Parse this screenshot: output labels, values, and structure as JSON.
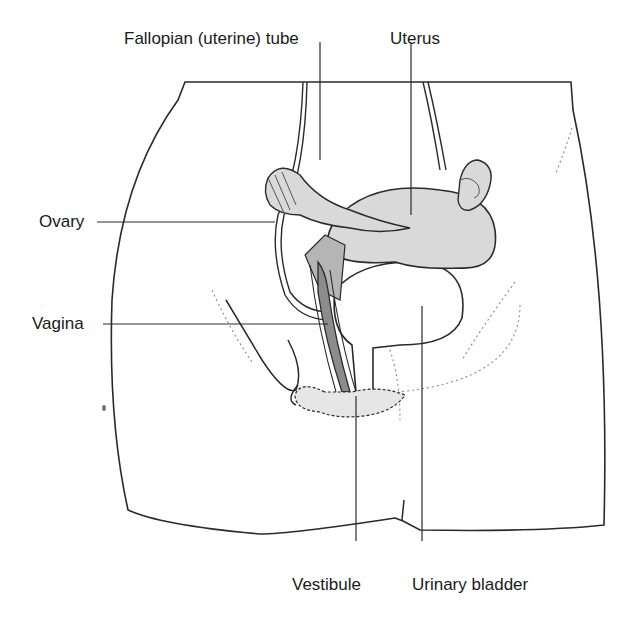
{
  "diagram": {
    "labels": [
      {
        "id": "fallopian-tube",
        "text": "Fallopian (uterine) tube"
      },
      {
        "id": "uterus",
        "text": "Uterus"
      },
      {
        "id": "ovary",
        "text": "Ovary"
      },
      {
        "id": "vagina",
        "text": "Vagina"
      },
      {
        "id": "vestibule",
        "text": "Vestibule"
      },
      {
        "id": "urinary-bladder",
        "text": "Urinary bladder"
      }
    ],
    "colors": {
      "outline": "#2a2a2a",
      "organ_fill": "#d9d9d9",
      "dark_fill": "#8c8c8c",
      "vestibule_fill": "#e6e6e6",
      "dotted": "#8a8a8a"
    }
  }
}
